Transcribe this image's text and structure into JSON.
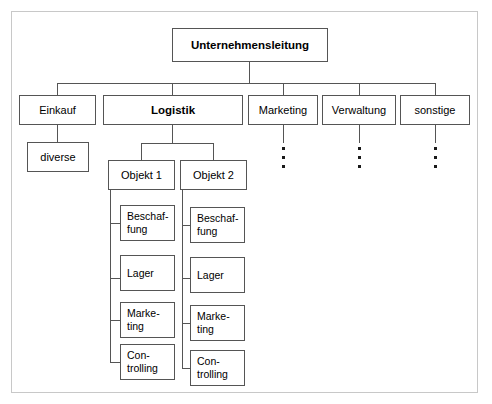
{
  "diagram": {
    "root": {
      "label": "Unternehmensleitung",
      "bold": true
    },
    "level1": [
      {
        "label": "Einkauf",
        "bold": false
      },
      {
        "label": "Logistik",
        "bold": true
      },
      {
        "label": "Marketing",
        "bold": false
      },
      {
        "label": "Verwaltung",
        "bold": false
      },
      {
        "label": "sonstige",
        "bold": false
      }
    ],
    "einkauf_child": {
      "label": "diverse"
    },
    "logistik_children": [
      {
        "label": "Objekt 1"
      },
      {
        "label": "Objekt 2"
      }
    ],
    "objekt1_children": [
      {
        "label": "Beschaf-\nfung"
      },
      {
        "label": "Lager"
      },
      {
        "label": "Marke-\nting"
      },
      {
        "label": "Con-\ntrolling"
      }
    ],
    "objekt2_children": [
      {
        "label": "Beschaf-\nfung"
      },
      {
        "label": "Lager"
      },
      {
        "label": "Marke-\nting"
      },
      {
        "label": "Con-\ntrolling"
      }
    ],
    "ellipsis": {
      "dot_count": 3,
      "under": [
        "Marketing",
        "Verwaltung",
        "sonstige"
      ]
    },
    "colors": {
      "box_border": "#555555",
      "frame_border": "#c8c8c8",
      "connector": "#555555",
      "text": "#000000",
      "background": "#ffffff",
      "dot": "#1a1a1a"
    }
  }
}
